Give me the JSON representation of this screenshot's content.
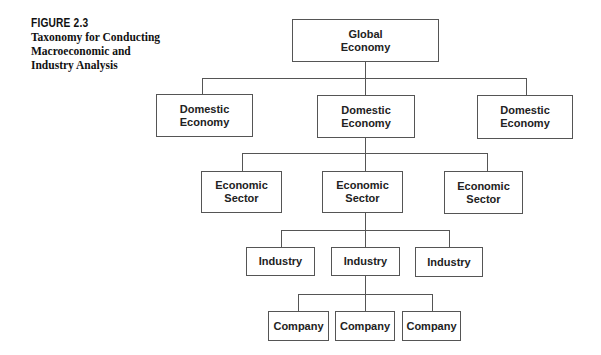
{
  "figure": {
    "label": "FIGURE 2.3",
    "title": "Taxonomy for Conducting Macroeconomic and Industry Analysis"
  },
  "diagram": {
    "root": {
      "label": "Global\nEconomy"
    },
    "level1": [
      {
        "label": "Domestic\nEconomy"
      },
      {
        "label": "Domestic\nEconomy"
      },
      {
        "label": "Domestic\nEconomy"
      }
    ],
    "level2": [
      {
        "label": "Economic\nSector"
      },
      {
        "label": "Economic\nSector"
      },
      {
        "label": "Economic\nSector"
      }
    ],
    "level3": [
      {
        "label": "Industry"
      },
      {
        "label": "Industry"
      },
      {
        "label": "Industry"
      }
    ],
    "level4": [
      {
        "label": "Company"
      },
      {
        "label": "Company"
      },
      {
        "label": "Company"
      }
    ],
    "colors": {
      "line": "#555555",
      "text": "#222222",
      "background": "#ffffff"
    }
  }
}
